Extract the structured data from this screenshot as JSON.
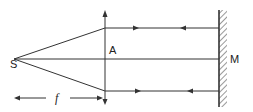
{
  "diagram": {
    "labels": {
      "source": "S",
      "lens": "A",
      "mirror": "M",
      "focal_length": "f"
    },
    "elements": {
      "source_point": {
        "x": 14,
        "y": 59
      },
      "lens": {
        "x": 105,
        "y_top": 12,
        "y_bottom": 104
      },
      "mirror": {
        "x": 219,
        "y_top": 10,
        "y_bottom": 107
      },
      "rays_y": [
        28,
        59,
        91
      ]
    },
    "colors": {
      "line": "#333333",
      "background": "#ffffff"
    }
  }
}
